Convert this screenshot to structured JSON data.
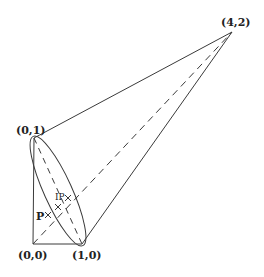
{
  "diagram": {
    "labels": {
      "apex": "(4,2)",
      "top_left": "(0,1)",
      "origin": "(0,0)",
      "bottom_right": "(1,0)",
      "point_p": "P",
      "point_ip": "IP"
    },
    "colors": {
      "stroke": "#3a3a3a",
      "background": "#ffffff"
    },
    "points": {
      "apex": [
        232,
        32
      ],
      "top_left": [
        34,
        138
      ],
      "origin": [
        33,
        244
      ],
      "bottom_right": [
        82,
        244
      ]
    }
  }
}
